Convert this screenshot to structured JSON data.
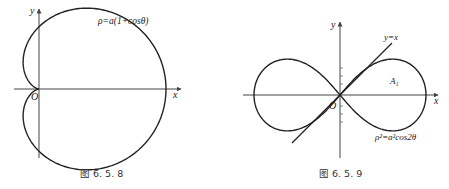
{
  "figures": [
    {
      "id": "fig-6-5-8",
      "caption": "图 6. 5. 8",
      "curve_label": "ρ=a(1+cosθ)",
      "axis_x_label": "x",
      "axis_y_label": "y",
      "origin_label": "O",
      "curve_type": "cardioid"
    },
    {
      "id": "fig-6-5-9",
      "caption": "图 6. 5. 9",
      "curve_label": "ρ²=a²cos2θ",
      "line_label": "y=x",
      "region_label": "A₁",
      "axis_x_label": "x",
      "axis_y_label": "y",
      "origin_label": "O",
      "curve_type": "lemniscate"
    }
  ],
  "colors": {
    "stroke": "#222222",
    "axis": "#444444",
    "background": "#ffffff"
  }
}
